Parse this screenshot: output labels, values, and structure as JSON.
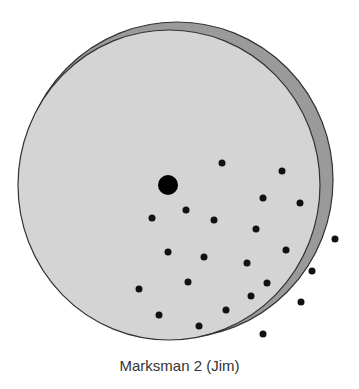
{
  "diagram": {
    "caption": "Marksman 2 (Jim)",
    "colors": {
      "face": "#d4d4d4",
      "rim": "#9a9a9a",
      "outline": "#333333",
      "dot": "#111111",
      "bullseye": "#000000",
      "background": "#ffffff"
    },
    "target": {
      "face": {
        "cx": 169,
        "cy": 185,
        "rx": 151,
        "ry": 155
      },
      "rim": {
        "cx": 177,
        "cy": 180,
        "rx": 156,
        "ry": 158
      },
      "bullseye": {
        "cx": 168,
        "cy": 185,
        "r": 10
      }
    },
    "shots": [
      {
        "x": 222,
        "y": 163
      },
      {
        "x": 282,
        "y": 171
      },
      {
        "x": 263,
        "y": 198
      },
      {
        "x": 300,
        "y": 203
      },
      {
        "x": 186,
        "y": 210
      },
      {
        "x": 152,
        "y": 218
      },
      {
        "x": 214,
        "y": 220
      },
      {
        "x": 256,
        "y": 229
      },
      {
        "x": 335,
        "y": 239
      },
      {
        "x": 286,
        "y": 250
      },
      {
        "x": 168,
        "y": 252
      },
      {
        "x": 204,
        "y": 257
      },
      {
        "x": 247,
        "y": 263
      },
      {
        "x": 312,
        "y": 271
      },
      {
        "x": 188,
        "y": 282
      },
      {
        "x": 267,
        "y": 283
      },
      {
        "x": 139,
        "y": 289
      },
      {
        "x": 251,
        "y": 296
      },
      {
        "x": 301,
        "y": 302
      },
      {
        "x": 226,
        "y": 310
      },
      {
        "x": 159,
        "y": 315
      },
      {
        "x": 199,
        "y": 326
      },
      {
        "x": 263,
        "y": 334
      }
    ],
    "shot_radius": 3.5
  }
}
